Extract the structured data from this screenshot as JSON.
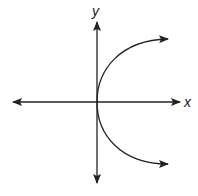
{
  "diagram": {
    "type": "coordinate-graph",
    "axes": {
      "x_label": "x",
      "y_label": "y"
    },
    "curve": {
      "shape": "parabola opening to the right",
      "vertex": "origin",
      "arrows": [
        "upper-right",
        "lower-right"
      ]
    },
    "colors": {
      "stroke": "#222222",
      "background": "#ffffff"
    }
  }
}
